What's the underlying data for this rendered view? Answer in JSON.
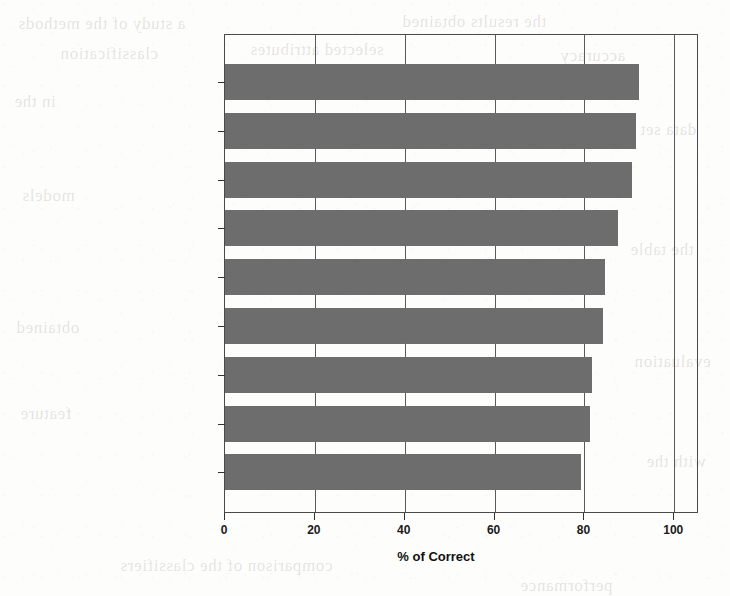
{
  "chart_data": {
    "type": "bar",
    "orientation": "horizontal",
    "title": "",
    "xlabel": "% of Correct",
    "ylabel": "",
    "xlim": [
      0,
      105.5
    ],
    "grid": true,
    "legend": false,
    "xticks": [
      "0",
      "20",
      "40",
      "60",
      "80",
      "100"
    ],
    "xtick_values": [
      0,
      20,
      40,
      60,
      80,
      100
    ],
    "bar_color": "#6d6d6d",
    "categories": [
      "MT-GA-variables-cases",
      "MT-GA-variables",
      "J48",
      "MT-PAM",
      "MT original",
      "Multilayer perceptron",
      "Random Forest",
      "SVM",
      "Naive Bayes"
    ],
    "values": [
      92.2,
      91.4,
      90.6,
      87.4,
      84.6,
      84.2,
      81.6,
      81.2,
      79.2
    ]
  },
  "bleed_through": [
    {
      "text": "a study of the methods",
      "x": 18,
      "y": 14
    },
    {
      "text": "the results obtained",
      "x": 402,
      "y": 12
    },
    {
      "text": "classification",
      "x": 60,
      "y": 44
    },
    {
      "text": "selected attributes",
      "x": 250,
      "y": 40
    },
    {
      "text": "accuracy",
      "x": 560,
      "y": 46
    },
    {
      "text": "in the",
      "x": 14,
      "y": 92
    },
    {
      "text": "data set",
      "x": 640,
      "y": 120
    },
    {
      "text": "models",
      "x": 22,
      "y": 186
    },
    {
      "text": "the table",
      "x": 630,
      "y": 240
    },
    {
      "text": "obtained",
      "x": 16,
      "y": 318
    },
    {
      "text": "evaluation",
      "x": 634,
      "y": 352
    },
    {
      "text": "feature",
      "x": 20,
      "y": 404
    },
    {
      "text": "with the",
      "x": 646,
      "y": 452
    },
    {
      "text": "comparison of the classifiers",
      "x": 120,
      "y": 556
    },
    {
      "text": "performance",
      "x": 520,
      "y": 576
    }
  ]
}
